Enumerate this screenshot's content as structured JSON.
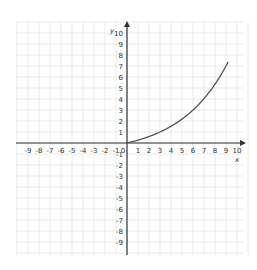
{
  "chart_data": {
    "type": "line",
    "title": "",
    "xlabel": "x",
    "ylabel": "y",
    "xlim": [
      -9,
      10
    ],
    "ylim": [
      -9,
      10
    ],
    "grid": true,
    "x_ticks": [
      "-9",
      "-8",
      "-7",
      "-6",
      "-5",
      "-4",
      "-3",
      "-2",
      "-1",
      "0",
      "1",
      "2",
      "3",
      "4",
      "5",
      "6",
      "7",
      "8",
      "9",
      "10"
    ],
    "y_ticks": [
      "10",
      "9",
      "8",
      "7",
      "6",
      "5",
      "4",
      "3",
      "2",
      "1",
      "-1",
      "-2",
      "-3",
      "-4",
      "-5",
      "-6",
      "-7",
      "-8",
      "-9"
    ],
    "series": [
      {
        "name": "curve",
        "x": [
          0,
          1,
          2,
          3,
          4,
          5,
          6,
          7,
          8,
          9,
          9.2
        ],
        "y": [
          0,
          0.26,
          0.59,
          1.0,
          1.52,
          2.17,
          3.0,
          4.04,
          5.35,
          7.0,
          7.4
        ]
      }
    ],
    "colors": {
      "axis": "#333333",
      "grid": "#e6e6e6",
      "curve": "#555555"
    }
  }
}
